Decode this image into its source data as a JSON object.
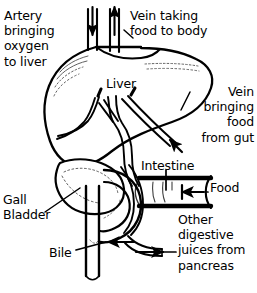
{
  "diagram": {
    "background_color": "#ffffff",
    "ink_color": "#000000",
    "labels": {
      "artery": "Artery\nbringing\noxygen\nto liver",
      "vein_taking": "Vein taking\nfood to body",
      "liver": "Liver",
      "vein_bringing": "Vein\nbringing\nfood\nfrom gut",
      "intestine": "Intestine",
      "food": "Food",
      "gall_bladder": "Gall\nBladder",
      "bile": "Bile",
      "other_juices": "Other\ndigestive\njuices from\npancreas"
    },
    "parts": [
      "liver",
      "gall-bladder",
      "duodenum",
      "hepatic-artery",
      "hepatic-vein",
      "portal-vein",
      "bile-duct",
      "pancreatic-duct"
    ],
    "flow_arrows": [
      {
        "name": "artery-into-liver",
        "direction": "down"
      },
      {
        "name": "vein-out-of-liver",
        "direction": "up"
      },
      {
        "name": "portal-vein-into-liver",
        "direction": "up-left"
      },
      {
        "name": "food-into-intestine",
        "direction": "left"
      },
      {
        "name": "bile-into-intestine",
        "direction": "left"
      },
      {
        "name": "pancreatic-juice-into-intestine",
        "direction": "right"
      }
    ]
  }
}
